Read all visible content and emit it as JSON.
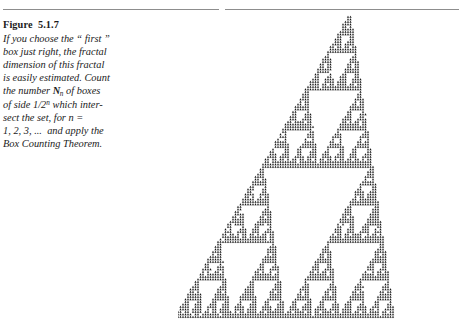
{
  "figure": {
    "label": "Figure",
    "number": "5.1.7",
    "title_text": "Figure  5.1.7",
    "caption_lines": [
      "If you choose the “ first ”",
      "box just right, the fractal",
      "dimension of this fractal",
      "is easily estimated. Count",
      "the number ᵍn of boxes",
      "of side 1/2ⁿ which inter-",
      "sect the set, for n =",
      "1, 2, 3, …  and apply the",
      "Box Counting Theorem."
    ],
    "caption_full_text": "If you choose the “first” box just right, the fractal dimension of this fractal is easily estimated. Count the number ᵍn of boxes of side 1/2ⁿ which intersect the set, for n = 1, 2, 3, … and apply the Box Counting Theorem.",
    "caption_line_5_parts": {
      "pre": "the number ",
      "symbol": "N",
      "subscript": "n",
      "post": " of boxes"
    },
    "caption_line_6_parts": {
      "pre": "of side 1/2",
      "superscript": "n",
      "post": " which inter-"
    },
    "caption_line_7_parts": {
      "text": "sect the set, for n ="
    },
    "caption_line_8_parts": {
      "text": "1, 2, 3, ...  and apply the"
    },
    "caption_line_9_parts": {
      "text": "Box Counting Theorem."
    }
  },
  "rule": {
    "present": true,
    "color": "#8d8d8d"
  },
  "colors": {
    "page_background": "#ffffff",
    "text": "#1b1b1b",
    "rule": "#8d8d8d",
    "fractal_ink": "#1a1a1a"
  },
  "fractal": {
    "name": "box-counting-fractal",
    "description": "Self-similar iterated-function-system fractal resembling a sheared Sierpinski gasket built from small arrow/chevron motifs, occupying the right two-thirds of the figure and running from upper-right down to lower-right.",
    "ink_color": "#1a1a1a",
    "render_width": 284,
    "render_height": 312,
    "iterations": 7,
    "motif": "chevron-triangle",
    "maps": [
      {
        "a": 0.5,
        "b": 0.0,
        "c": 0.0,
        "d": 0.5,
        "e": 0.0,
        "f": 0.0
      },
      {
        "a": 0.5,
        "b": 0.0,
        "c": 0.0,
        "d": 0.5,
        "e": 0.5,
        "f": 0.0
      },
      {
        "a": 0.5,
        "b": 0.0,
        "c": 0.0,
        "d": 0.5,
        "e": 0.25,
        "f": 0.5
      }
    ],
    "base_triangle": [
      {
        "x": 0.06,
        "y": 1.0
      },
      {
        "x": 1.02,
        "y": 0.0
      },
      {
        "x": 1.02,
        "y": 1.0
      }
    ],
    "shear": -0.3,
    "motif_scale": 0.085
  }
}
